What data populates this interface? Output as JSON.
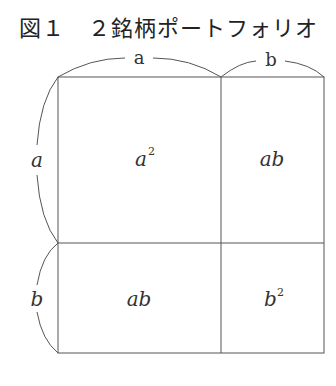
{
  "title": "図１　２銘柄ポートフォリオ",
  "top_labels": {
    "a": "a",
    "b": "b"
  },
  "side_labels": {
    "a": "a",
    "b": "b"
  },
  "cells": {
    "top_left": {
      "base": "a",
      "exp": "2"
    },
    "top_right": {
      "text": "ab"
    },
    "bottom_left": {
      "text": "ab"
    },
    "bottom_right": {
      "base": "b",
      "exp": "2"
    }
  }
}
